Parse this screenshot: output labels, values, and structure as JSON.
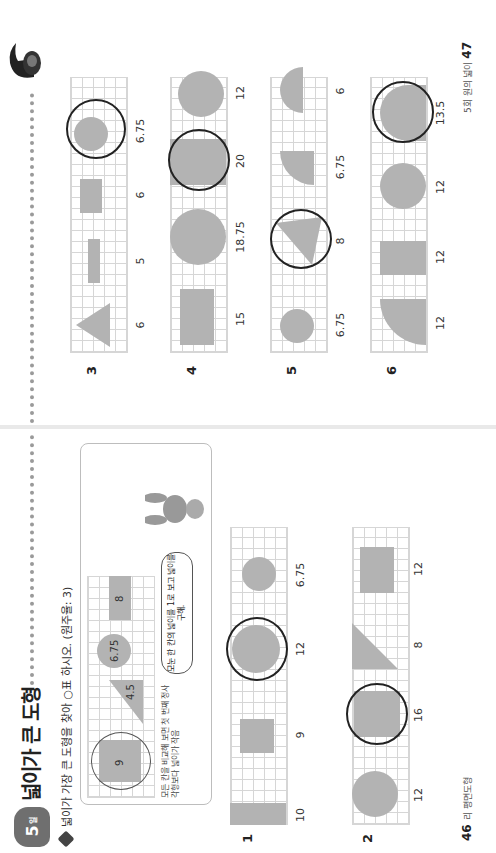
{
  "lesson": {
    "badge_number": "5",
    "badge_suffix": "일",
    "title": "넓이가 큰 도형"
  },
  "instruction": "넓이가 가장 큰 도형을 찾아 ○표 하시오. (원주율: 3)",
  "example": {
    "shapes": [
      {
        "type": "square-in-circle",
        "label": "9"
      },
      {
        "type": "triangle",
        "label": "4.5"
      },
      {
        "type": "circle",
        "label": "6.75"
      },
      {
        "type": "rectangle",
        "label": "8"
      }
    ],
    "hint": "모든 칸을 비교해 보면 첫 번째 정사각형보다 넓이가 작음",
    "speech": "모눈 한 칸의 넓이를 1로 보고 넓이를 구해."
  },
  "problems": [
    {
      "number": "1",
      "values": [
        "10",
        "9",
        "12",
        "6.75"
      ],
      "answer_index": 2
    },
    {
      "number": "2",
      "values": [
        "12",
        "16",
        "8",
        "12"
      ],
      "answer_index": 1
    },
    {
      "number": "3",
      "values": [
        "6",
        "5",
        "6",
        "6.75"
      ],
      "answer_index": 3
    },
    {
      "number": "4",
      "values": [
        "15",
        "18.75",
        "20",
        "12"
      ],
      "answer_index": 2
    },
    {
      "number": "5",
      "values": [
        "6.75",
        "8",
        "6.75",
        "6"
      ],
      "answer_index": 1
    },
    {
      "number": "6",
      "values": [
        "12",
        "12",
        "12",
        "13.5"
      ],
      "answer_index": 3
    }
  ],
  "footer": {
    "left_page_number": "46",
    "left_text": "리 평면도형",
    "right_page_number": "47",
    "right_text": "5회 원의 넓이"
  }
}
